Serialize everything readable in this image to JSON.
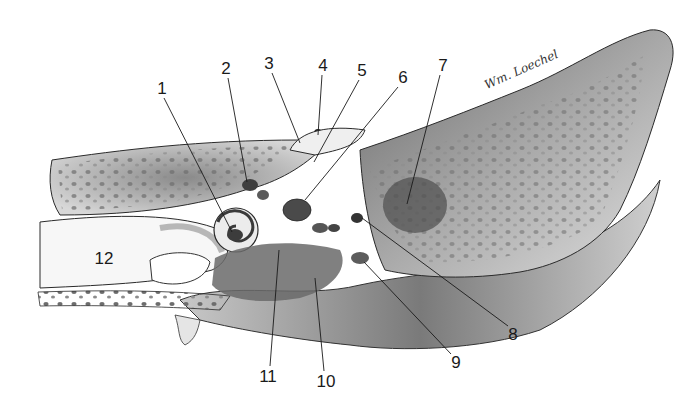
{
  "figure": {
    "signature": "Wm. Loechel",
    "colors": {
      "ink": "#1a1a1a",
      "bone_light": "#e6e6e6",
      "bone_mid": "#b5b5b5",
      "bone_dark": "#5a5a5a",
      "background": "#ffffff"
    }
  },
  "labels": [
    {
      "id": "1",
      "text": "1",
      "x": 162,
      "y": 88,
      "line_to": [
        232,
        232
      ]
    },
    {
      "id": "2",
      "text": "2",
      "x": 226,
      "y": 68,
      "line_to": [
        247,
        182
      ]
    },
    {
      "id": "3",
      "text": "3",
      "x": 269,
      "y": 63,
      "line_to": [
        300,
        143
      ]
    },
    {
      "id": "4",
      "text": "4",
      "x": 323,
      "y": 65,
      "line_to": [
        318,
        135
      ]
    },
    {
      "id": "5",
      "text": "5",
      "x": 362,
      "y": 70,
      "line_to": [
        314,
        162
      ]
    },
    {
      "id": "6",
      "text": "6",
      "x": 403,
      "y": 77,
      "line_to": [
        305,
        200
      ]
    },
    {
      "id": "7",
      "text": "7",
      "x": 443,
      "y": 65,
      "line_to": [
        407,
        204
      ]
    },
    {
      "id": "8",
      "text": "8",
      "x": 513,
      "y": 334,
      "line_to": [
        362,
        218
      ]
    },
    {
      "id": "9",
      "text": "9",
      "x": 456,
      "y": 362,
      "line_to": [
        364,
        262
      ]
    },
    {
      "id": "10",
      "text": "10",
      "x": 326,
      "y": 381,
      "line_to": [
        315,
        278
      ]
    },
    {
      "id": "11",
      "text": "11",
      "x": 268,
      "y": 376,
      "line_to": [
        279,
        250
      ]
    },
    {
      "id": "12",
      "text": "12",
      "x": 104,
      "y": 258,
      "line_to": null
    }
  ]
}
